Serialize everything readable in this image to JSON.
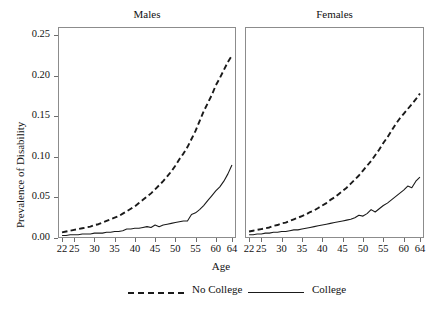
{
  "chart_data": {
    "type": "line",
    "title": "",
    "xlabel": "Age",
    "ylabel": "Prevalence of Disability",
    "xlim": [
      21,
      65
    ],
    "ylim": [
      0,
      0.26
    ],
    "xticks": [
      22,
      25,
      30,
      35,
      40,
      45,
      50,
      55,
      60,
      64
    ],
    "xtick_labels": [
      "22",
      "25",
      "30",
      "35",
      "40",
      "45",
      "50",
      "55",
      "60",
      "64"
    ],
    "yticks": [
      0.0,
      0.05,
      0.1,
      0.15,
      0.2,
      0.25
    ],
    "ytick_labels": [
      "0.00",
      "0.05",
      "0.10",
      "0.15",
      "0.20",
      "0.25"
    ],
    "grid": false,
    "legend_position": "bottom",
    "legend": [
      {
        "label": "No College",
        "style": "dashed"
      },
      {
        "label": "College",
        "style": "solid"
      }
    ],
    "panels": [
      {
        "title": "Males",
        "x": [
          22,
          23,
          24,
          25,
          26,
          27,
          28,
          29,
          30,
          31,
          32,
          33,
          34,
          35,
          36,
          37,
          38,
          39,
          40,
          41,
          42,
          43,
          44,
          45,
          46,
          47,
          48,
          49,
          50,
          51,
          52,
          53,
          54,
          55,
          56,
          57,
          58,
          59,
          60,
          61,
          62,
          63,
          64
        ],
        "series": [
          {
            "name": "No College",
            "style": "dashed",
            "values": [
              0.007,
              0.008,
              0.009,
              0.01,
              0.011,
              0.012,
              0.013,
              0.014,
              0.016,
              0.017,
              0.019,
              0.021,
              0.023,
              0.025,
              0.027,
              0.03,
              0.033,
              0.036,
              0.039,
              0.043,
              0.047,
              0.051,
              0.055,
              0.06,
              0.065,
              0.07,
              0.076,
              0.082,
              0.089,
              0.097,
              0.104,
              0.112,
              0.122,
              0.132,
              0.144,
              0.156,
              0.166,
              0.176,
              0.188,
              0.197,
              0.207,
              0.217,
              0.225
            ]
          },
          {
            "name": "College",
            "style": "solid",
            "values": [
              0.003,
              0.003,
              0.004,
              0.004,
              0.004,
              0.005,
              0.005,
              0.005,
              0.006,
              0.006,
              0.006,
              0.007,
              0.007,
              0.008,
              0.008,
              0.009,
              0.011,
              0.011,
              0.012,
              0.012,
              0.013,
              0.014,
              0.013,
              0.016,
              0.014,
              0.016,
              0.017,
              0.018,
              0.019,
              0.02,
              0.021,
              0.021,
              0.029,
              0.031,
              0.035,
              0.04,
              0.046,
              0.052,
              0.058,
              0.063,
              0.07,
              0.079,
              0.09
            ]
          }
        ]
      },
      {
        "title": "Females",
        "x": [
          22,
          23,
          24,
          25,
          26,
          27,
          28,
          29,
          30,
          31,
          32,
          33,
          34,
          35,
          36,
          37,
          38,
          39,
          40,
          41,
          42,
          43,
          44,
          45,
          46,
          47,
          48,
          49,
          50,
          51,
          52,
          53,
          54,
          55,
          56,
          57,
          58,
          59,
          60,
          61,
          62,
          63,
          64
        ],
        "series": [
          {
            "name": "No College",
            "style": "dashed",
            "values": [
              0.008,
              0.009,
              0.01,
              0.011,
              0.012,
              0.013,
              0.015,
              0.016,
              0.018,
              0.019,
              0.021,
              0.023,
              0.025,
              0.027,
              0.029,
              0.032,
              0.034,
              0.037,
              0.04,
              0.043,
              0.047,
              0.05,
              0.054,
              0.058,
              0.062,
              0.067,
              0.072,
              0.077,
              0.083,
              0.089,
              0.095,
              0.102,
              0.109,
              0.117,
              0.124,
              0.132,
              0.14,
              0.147,
              0.153,
              0.159,
              0.165,
              0.171,
              0.178
            ]
          },
          {
            "name": "College",
            "style": "solid",
            "values": [
              0.004,
              0.004,
              0.005,
              0.005,
              0.006,
              0.006,
              0.007,
              0.007,
              0.008,
              0.008,
              0.009,
              0.01,
              0.01,
              0.011,
              0.012,
              0.013,
              0.014,
              0.015,
              0.016,
              0.017,
              0.018,
              0.019,
              0.02,
              0.021,
              0.022,
              0.023,
              0.025,
              0.028,
              0.027,
              0.03,
              0.035,
              0.032,
              0.036,
              0.04,
              0.043,
              0.047,
              0.051,
              0.055,
              0.059,
              0.064,
              0.062,
              0.07,
              0.075
            ]
          }
        ]
      }
    ]
  }
}
